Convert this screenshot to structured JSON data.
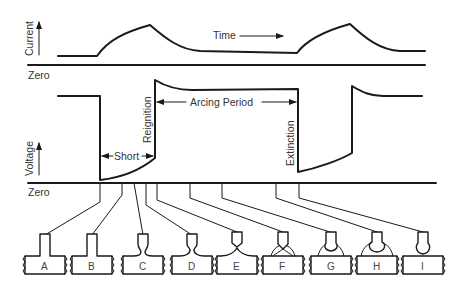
{
  "diagram": {
    "labels": {
      "current_axis": "Current",
      "voltage_axis": "Voltage",
      "time": "Time",
      "zero_top": "Zero",
      "zero_bottom": "Zero",
      "short": "Short",
      "reignition": "Reignition",
      "arcing_period": "Arcing Period",
      "extinction": "Extinction"
    },
    "stages": [
      {
        "label": "A"
      },
      {
        "label": "B"
      },
      {
        "label": "C"
      },
      {
        "label": "D"
      },
      {
        "label": "E"
      },
      {
        "label": "F"
      },
      {
        "label": "G"
      },
      {
        "label": "H"
      },
      {
        "label": "I"
      }
    ],
    "colors": {
      "line": "#1a1a1a",
      "text": "#333333",
      "background": "#ffffff"
    }
  }
}
